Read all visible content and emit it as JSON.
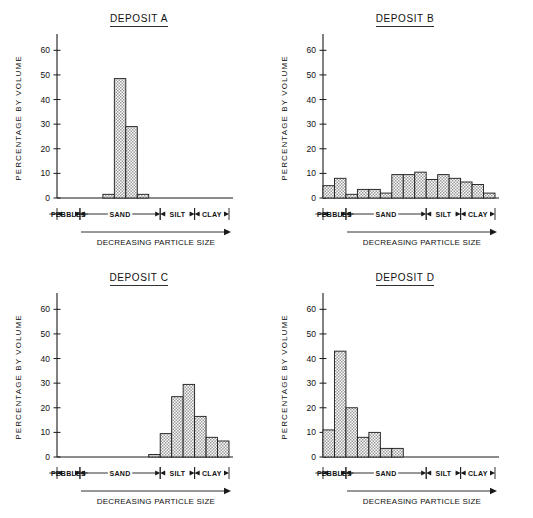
{
  "figure": {
    "axis_label_y": "PERCENTAGE  BY  VOLUME",
    "axis_arrow_label": "DECREASING PARTICLE SIZE",
    "y_ticks": [
      "0",
      "10",
      "20",
      "30",
      "40",
      "50",
      "60"
    ],
    "categories": [
      "PEBBLES",
      "SAND",
      "SILT",
      "CLAY"
    ],
    "colors": {
      "ink": "#1a1a1a",
      "bar_fill": "#d9d9d9",
      "background": "#ffffff"
    }
  },
  "chart_data": [
    {
      "type": "bar",
      "title": "DEPOSIT  A",
      "xlabel": "DECREASING PARTICLE SIZE",
      "ylabel": "PERCENTAGE  BY  VOLUME",
      "ylim": [
        0,
        65
      ],
      "yticks": [
        0,
        10,
        20,
        30,
        40,
        50,
        60
      ],
      "grid": false,
      "legend": "none",
      "categories": [
        "PEBBLES",
        "SAND",
        "SILT",
        "CLAY"
      ],
      "category_spans": [
        [
          0,
          2
        ],
        [
          2,
          9
        ],
        [
          9,
          12
        ],
        [
          12,
          15
        ]
      ],
      "values": [
        0,
        0,
        0,
        0,
        1.5,
        48.5,
        29,
        1.5,
        0,
        0,
        0,
        0,
        0,
        0,
        0
      ]
    },
    {
      "type": "bar",
      "title": "DEPOSIT  B",
      "xlabel": "DECREASING PARTICLE SIZE",
      "ylabel": "PERCENTAGE  BY  VOLUME",
      "ylim": [
        0,
        65
      ],
      "yticks": [
        0,
        10,
        20,
        30,
        40,
        50,
        60
      ],
      "grid": false,
      "legend": "none",
      "categories": [
        "PEBBLES",
        "SAND",
        "SILT",
        "CLAY"
      ],
      "category_spans": [
        [
          0,
          2
        ],
        [
          2,
          9
        ],
        [
          9,
          12
        ],
        [
          12,
          15
        ]
      ],
      "values": [
        5,
        8,
        1.5,
        3.5,
        3.5,
        2,
        9.5,
        9.5,
        10.5,
        7.5,
        9.5,
        8,
        6.5,
        5.5,
        2
      ]
    },
    {
      "type": "bar",
      "title": "DEPOSIT  C",
      "xlabel": "DECREASING PARTICLE SIZE",
      "ylabel": "PERCENTAGE  BY  VOLUME",
      "ylim": [
        0,
        65
      ],
      "yticks": [
        0,
        10,
        20,
        30,
        40,
        50,
        60
      ],
      "grid": false,
      "legend": "none",
      "categories": [
        "PEBBLES",
        "SAND",
        "SILT",
        "CLAY"
      ],
      "category_spans": [
        [
          0,
          2
        ],
        [
          2,
          9
        ],
        [
          9,
          12
        ],
        [
          12,
          15
        ]
      ],
      "values": [
        0,
        0,
        0,
        0,
        0,
        0,
        0,
        0,
        1,
        9.5,
        24.5,
        29.5,
        16.5,
        8,
        6.5
      ]
    },
    {
      "type": "bar",
      "title": "DEPOSIT  D",
      "xlabel": "DECREASING PARTICLE SIZE",
      "ylabel": "PERCENTAGE  BY  VOLUME",
      "ylim": [
        0,
        65
      ],
      "yticks": [
        0,
        10,
        20,
        30,
        40,
        50,
        60
      ],
      "grid": false,
      "legend": "none",
      "categories": [
        "PEBBLES",
        "SAND",
        "SILT",
        "CLAY"
      ],
      "category_spans": [
        [
          0,
          2
        ],
        [
          2,
          9
        ],
        [
          9,
          12
        ],
        [
          12,
          15
        ]
      ],
      "values": [
        11,
        43,
        20,
        8,
        10,
        3.5,
        3.5,
        0,
        0,
        0,
        0,
        0,
        0,
        0,
        0
      ]
    }
  ]
}
